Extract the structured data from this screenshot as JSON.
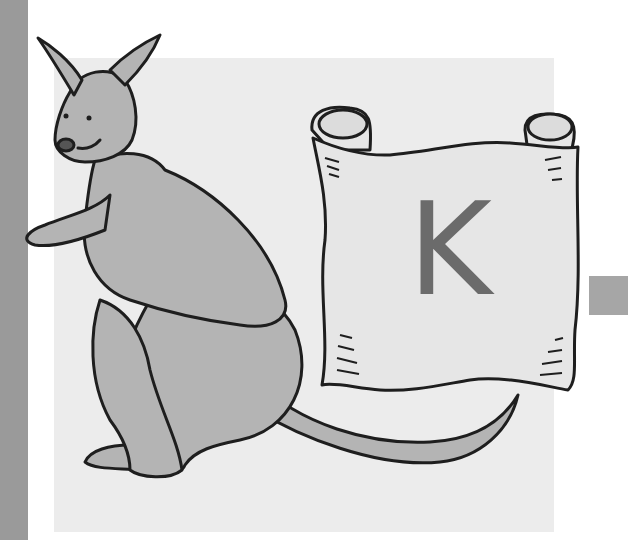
{
  "illustration": {
    "subject": "kangaroo",
    "scroll_letter": "K",
    "colors": {
      "left_bar": "#9a9a9a",
      "background_square": "#ececec",
      "side_square": "#a6a6a6",
      "kangaroo_fill": "#b4b4b4",
      "scroll_fill": "#e6e6e6",
      "outline": "#1e1e1e",
      "letter": "#6b6b6b"
    }
  }
}
